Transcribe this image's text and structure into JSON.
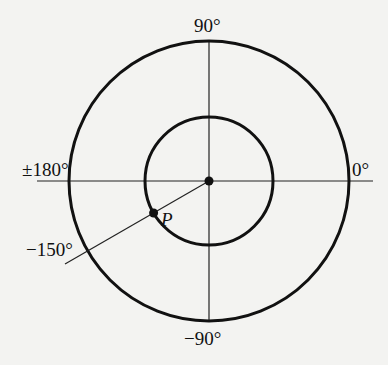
{
  "diagram": {
    "type": "polar-angle-diagram",
    "center": {
      "x": 209,
      "y": 181
    },
    "outer_circle": {
      "radius": 140,
      "stroke": "#111111",
      "stroke_width": 3
    },
    "inner_circle": {
      "radius": 64,
      "stroke": "#111111",
      "stroke_width": 3
    },
    "axes": {
      "horizontal": {
        "x1": 37,
        "x2": 373
      },
      "vertical": {
        "y1": 41,
        "y2": 322
      },
      "stroke": "#222222",
      "stroke_width": 1.2
    },
    "ray": {
      "angle_deg": -150,
      "end": {
        "x": 65,
        "y": 264
      },
      "stroke": "#222222",
      "stroke_width": 1.2
    },
    "point": {
      "label": "P",
      "x": 153.6,
      "y": 213,
      "radius": 4.5
    },
    "center_dot_radius": 4.5,
    "labels": {
      "top": "90°",
      "bottom": "−90°",
      "right": "0°",
      "left": "±180°",
      "ray": "−150°",
      "point": "P"
    }
  }
}
